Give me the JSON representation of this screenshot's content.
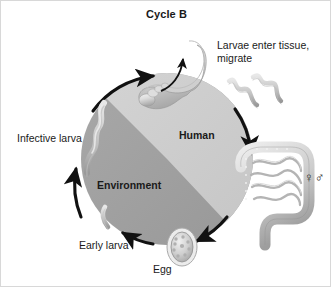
{
  "figure": {
    "title": "Cycle B",
    "width": 331,
    "height": 287
  },
  "labels": {
    "larvae_enter": "Larvae enter tissue, migrate",
    "infective_larva": "Infective larva",
    "human": "Human",
    "environment": "Environment",
    "early_larva": "Early larva",
    "egg": "Egg",
    "sex_symbols": "♀♂"
  },
  "colors": {
    "human_sector": "#c9c9c9",
    "environment_sector": "#a0a0a0",
    "arrow": "#111111",
    "text": "#1a1a1a",
    "illustration_light": "#e2e2e2",
    "illustration_mid": "#b9b9b9",
    "illustration_dark": "#8c8c8c",
    "background": "#ffffff"
  },
  "diagram": {
    "type": "life-cycle",
    "center": {
      "x": 166,
      "y": 158
    },
    "radius": 86,
    "sectors": [
      {
        "name": "Human",
        "position": "upper-right",
        "shade": "light"
      },
      {
        "name": "Environment",
        "position": "lower-left",
        "shade": "dark"
      }
    ],
    "stages": [
      {
        "name": "foot",
        "label": "Larvae enter tissue, migrate",
        "position": "top"
      },
      {
        "name": "migrating-larvae",
        "label": "Larvae enter tissue, migrate",
        "position": "top-right"
      },
      {
        "name": "intestine",
        "label": "♀♂",
        "position": "right"
      },
      {
        "name": "egg",
        "label": "Egg",
        "position": "bottom"
      },
      {
        "name": "early-larva",
        "label": "Early larva",
        "position": "bottom-left"
      },
      {
        "name": "infective-larva",
        "label": "Infective larva",
        "position": "left"
      }
    ],
    "arrows": [
      {
        "name": "arrow-to-foot",
        "from": "infective-larva",
        "to": "foot",
        "direction": "clockwise"
      },
      {
        "name": "arrow-to-intestine",
        "from": "foot",
        "to": "intestine",
        "direction": "clockwise"
      },
      {
        "name": "arrow-to-egg",
        "from": "intestine",
        "to": "egg",
        "direction": "clockwise"
      },
      {
        "name": "arrow-to-early-larva",
        "from": "egg",
        "to": "early-larva",
        "direction": "clockwise"
      },
      {
        "name": "arrow-to-infective-larva",
        "from": "early-larva",
        "to": "infective-larva",
        "direction": "clockwise"
      },
      {
        "name": "arrow-skin-penetration",
        "from": "foot-sole",
        "to": "ankle",
        "direction": "upward"
      }
    ]
  }
}
